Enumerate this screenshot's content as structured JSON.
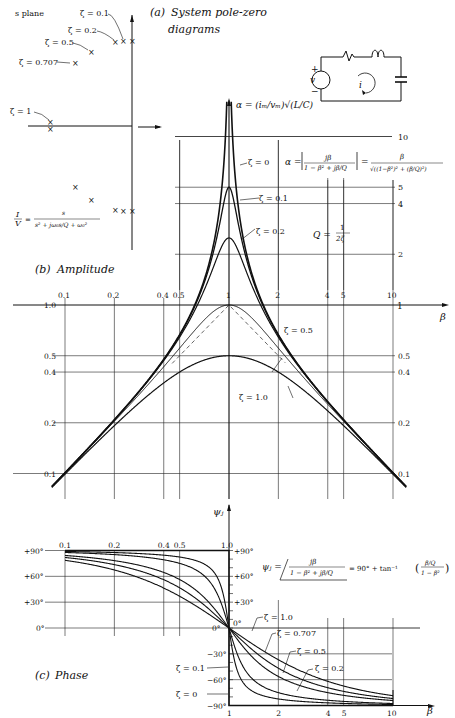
{
  "panels": {
    "a": {
      "label": "(a)",
      "title_line1": "System pole-zero",
      "title_line2": "diagrams",
      "plane_label": "s plane",
      "pole_labels": [
        "ζ = 0.1",
        "ζ = 0.2",
        "ζ = 0.5",
        "ζ = 0.707",
        "ζ = 1"
      ],
      "transfer_fn": {
        "lhs_num": "I",
        "lhs_den": "V",
        "rhs_num": "s",
        "rhs_den": "s² + jω₀s/Q + ω₀²"
      },
      "circuit": {
        "source_label": "v",
        "plus": "+",
        "minus": "−",
        "current_label": "i"
      }
    },
    "b": {
      "label": "(b)",
      "title": "Amplitude",
      "alpha_def": "α = (iₘ/vₘ)√(L/C)",
      "alpha_eq_lhs": "α =",
      "alpha_eq_num": "jβ",
      "alpha_eq_den": "1 − β² + jβ/Q",
      "alpha_eq_rhs_num": "β",
      "alpha_eq_rhs_den": "√((1−β²)² + (β/Q)²)",
      "q_def_lhs": "Q =",
      "q_def_num": "1",
      "q_def_den": "2ζ",
      "beta_label": "β",
      "curve_labels": [
        "ζ = 0",
        "ζ = 0.1",
        "ζ = 0.2",
        "ζ = 0.5",
        "ζ = 1.0"
      ]
    },
    "c": {
      "label": "(c)",
      "title": "Phase",
      "psi_label": "ψⱼ",
      "psi_eq_lhs": "ψⱼ =",
      "psi_eq_num": "jβ",
      "psi_eq_den": "1 − β² + jβ/Q",
      "psi_eq_rhs": "= 90° + tan⁻¹",
      "psi_eq_frac_num": "β/Q",
      "psi_eq_frac_den": "1 − β²",
      "beta_label": "β",
      "curve_labels": [
        "ζ = 1.0",
        "ζ = 0.707",
        "ζ = 0.5",
        "ζ = 0.2",
        "ζ = 0.1",
        "ζ = 0"
      ]
    }
  },
  "chart_data": [
    {
      "type": "line",
      "title": "(b) Amplitude",
      "xlabel": "β",
      "ylabel": "α",
      "xscale": "log",
      "yscale": "log",
      "xlim": [
        0.1,
        10
      ],
      "ylim": [
        0.1,
        10
      ],
      "x_ticks": [
        "0.1",
        "0.2",
        "0.4",
        "0.5",
        "1",
        "2",
        "4",
        "5",
        "10"
      ],
      "y_ticks_left": [
        "0.1",
        "0.2",
        "0.4",
        "0.5",
        "1.0"
      ],
      "y_ticks_right": [
        "0.1",
        "0.2",
        "0.4",
        "0.5",
        "1",
        "2",
        "4",
        "5",
        "10"
      ],
      "grid": true,
      "series": [
        {
          "name": "ζ = 0",
          "peak": "∞ at β=1"
        },
        {
          "name": "ζ = 0.1",
          "peak": 5.0
        },
        {
          "name": "ζ = 0.2",
          "peak": 2.5
        },
        {
          "name": "ζ = 0.5",
          "peak": 1.0
        },
        {
          "name": "ζ = 1.0",
          "peak": 0.5
        },
        {
          "name": "asymptote (dashed)",
          "peak": 1.0
        }
      ],
      "formula": "α = β / √((1−β²)² + (β/Q)²), Q = 1/(2ζ)"
    },
    {
      "type": "line",
      "title": "(c) Phase",
      "xlabel": "β",
      "ylabel": "ψⱼ",
      "xscale": "log",
      "xlim": [
        0.1,
        10
      ],
      "ylim": [
        -90,
        90
      ],
      "x_ticks": [
        "0.1",
        "0.2",
        "0.4",
        "0.5",
        "1.0",
        "1",
        "2",
        "4",
        "5",
        "10"
      ],
      "y_ticks": [
        "+90°",
        "+60°",
        "+30°",
        "0°",
        "−30°",
        "−60°",
        "−90°"
      ],
      "grid": true,
      "series": [
        {
          "name": "ζ = 0",
          "note": "step +90° → −90° at β=1"
        },
        {
          "name": "ζ = 0.1"
        },
        {
          "name": "ζ = 0.2"
        },
        {
          "name": "ζ = 0.5"
        },
        {
          "name": "ζ = 0.707"
        },
        {
          "name": "ζ = 1.0"
        }
      ],
      "formula": "ψⱼ = 90° + tan⁻¹((β/Q)/(1−β²))"
    }
  ],
  "ticks": {
    "amp_x": [
      "0.1",
      "0.2",
      "0.4",
      "0.5",
      "1",
      "2",
      "4",
      "5",
      "10"
    ],
    "amp_y_left": [
      "1.0",
      "0.5",
      "0.4",
      "0.2",
      "0.1"
    ],
    "amp_y_right": [
      "10",
      "5",
      "4",
      "2",
      "1",
      "0.5",
      "0.4",
      "0.2",
      "0.1"
    ],
    "ph_x_top": [
      "0.1",
      "0.2",
      "0.4",
      "0.5",
      "1.0"
    ],
    "ph_x_bot": [
      "1",
      "2",
      "4",
      "5",
      "10"
    ],
    "ph_y_left": [
      "+90°",
      "+60°",
      "+30°",
      "0°"
    ],
    "ph_y_mid": [
      "+90°",
      "+60°",
      "+30°",
      "0°",
      "−30°",
      "−60°",
      "−90°"
    ],
    "ph_y_mid_left0": "0°"
  }
}
